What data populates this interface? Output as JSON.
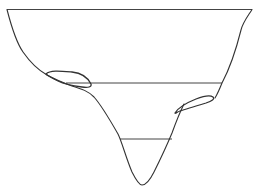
{
  "diagram": {
    "colors": {
      "background": "#ffffff",
      "stroke": "#333333"
    },
    "elements": [
      {
        "id": "profile",
        "kind": "outline"
      },
      {
        "id": "top-level",
        "kind": "level-line"
      },
      {
        "id": "middle-level",
        "kind": "level-line"
      },
      {
        "id": "bottom-level",
        "kind": "level-line"
      },
      {
        "id": "left-lens",
        "kind": "lens"
      },
      {
        "id": "right-lens",
        "kind": "lens"
      }
    ],
    "labels": []
  }
}
